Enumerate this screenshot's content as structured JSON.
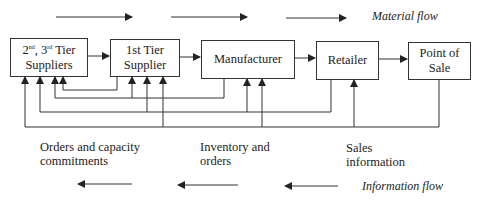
{
  "diagram": {
    "flow_legend": {
      "material": "Material flow",
      "information": "Information flow"
    },
    "nodes": [
      {
        "id": "tier23",
        "line1_a": "2",
        "line1_a_sup": "nd",
        "line1_b": ", 3",
        "line1_b_sup": "rd",
        "line1_c": " Tier",
        "line2": "Suppliers"
      },
      {
        "id": "tier1",
        "line1": "1st Tier",
        "line2": "Supplier"
      },
      {
        "id": "manufacturer",
        "label": "Manufacturer"
      },
      {
        "id": "retailer",
        "label": "Retailer"
      },
      {
        "id": "pos",
        "line1": "Point of",
        "line2": "Sale"
      }
    ],
    "edges_material": [
      {
        "from": "tier23",
        "to": "tier1"
      },
      {
        "from": "tier1",
        "to": "manufacturer"
      },
      {
        "from": "manufacturer",
        "to": "retailer"
      },
      {
        "from": "retailer",
        "to": "pos"
      }
    ],
    "edges_information": [
      {
        "from": "tier1",
        "to": [
          "tier23"
        ]
      },
      {
        "from": "manufacturer",
        "to": [
          "tier23",
          "tier1"
        ]
      },
      {
        "from": "retailer",
        "to": [
          "tier23",
          "tier1",
          "manufacturer"
        ]
      },
      {
        "from": "pos",
        "to": [
          "tier23",
          "tier1",
          "manufacturer",
          "retailer"
        ]
      }
    ],
    "annotations": [
      {
        "line1": "Orders and capacity",
        "line2": "commitments"
      },
      {
        "line1": "Inventory and",
        "line2": "orders"
      },
      {
        "line1": "Sales",
        "line2": "information"
      }
    ],
    "colors": {
      "stroke": "#333333",
      "text": "#222222",
      "background": "#ffffff"
    }
  }
}
